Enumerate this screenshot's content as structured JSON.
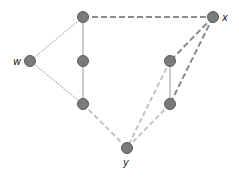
{
  "diagram": {
    "colors": {
      "node_fill": "#7a7a7a",
      "node_stroke": "#5a5a5a",
      "solid_edge": "#aaaaaa",
      "dotted_edge": "#777777",
      "dark_dashed": "#8a8a8a",
      "light_dashed": "#c4c4c4"
    },
    "nodes": [
      {
        "id": "w",
        "label": "w",
        "x": 30,
        "y": 61
      },
      {
        "id": "a1",
        "label": "",
        "x": 83,
        "y": 17
      },
      {
        "id": "a2",
        "label": "",
        "x": 83,
        "y": 61
      },
      {
        "id": "a3",
        "label": "",
        "x": 83,
        "y": 104
      },
      {
        "id": "x",
        "label": "x",
        "x": 213,
        "y": 17
      },
      {
        "id": "b1",
        "label": "",
        "x": 170,
        "y": 61
      },
      {
        "id": "b2",
        "label": "",
        "x": 170,
        "y": 104
      },
      {
        "id": "y",
        "label": "y",
        "x": 127,
        "y": 148
      }
    ],
    "edges": [
      {
        "from": "w",
        "to": "a1",
        "style": "dotted"
      },
      {
        "from": "w",
        "to": "a3",
        "style": "dotted"
      },
      {
        "from": "a1",
        "to": "a2",
        "style": "solid"
      },
      {
        "from": "a2",
        "to": "a3",
        "style": "solid"
      },
      {
        "from": "b1",
        "to": "b2",
        "style": "solid"
      },
      {
        "from": "a1",
        "to": "x",
        "style": "dark-dashed"
      },
      {
        "from": "x",
        "to": "b1",
        "style": "dark-dashed"
      },
      {
        "from": "x",
        "to": "b2",
        "style": "dark-dashed"
      },
      {
        "from": "a3",
        "to": "y",
        "style": "light-dashed"
      },
      {
        "from": "b1",
        "to": "y",
        "style": "light-dashed"
      },
      {
        "from": "b2",
        "to": "y",
        "style": "light-dashed"
      }
    ],
    "labels": {
      "w": "w",
      "x": "x",
      "y": "y"
    }
  }
}
